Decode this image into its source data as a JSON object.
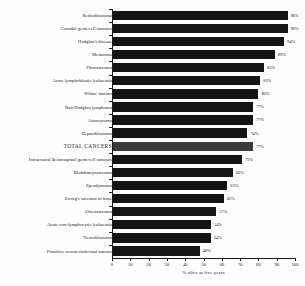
{
  "chart_data": {
    "type": "bar",
    "orientation": "horizontal",
    "title": "",
    "xlabel": "% alive at five years",
    "ylabel": "",
    "xlim": [
      0,
      100
    ],
    "xticks": [
      0,
      10,
      20,
      30,
      40,
      50,
      60,
      70,
      80,
      90,
      100
    ],
    "grid": false,
    "legend": null,
    "value_suffix": "%",
    "bar_color": "#141414",
    "highlight_color": "#3a3a3a",
    "highlight_category": "TOTAL CANCERS",
    "categories": [
      "Retinoblastoma",
      "Gonadal germ cell tumours",
      "Hodgkin's disease",
      "Melanoma",
      "Fibrosarcoma",
      "Acute lymphoblastic leukaemia",
      "Wilms' tumour",
      "Non-Hodgkin lymphoma",
      "Astrocytoma",
      "Hepatoblastoma",
      "TOTAL CANCERS",
      "Intracranial & intraspinal germ cell tumours",
      "Rhabdomyosarcoma",
      "Ependymoma",
      "Ewing's sarcoma of bone",
      "Osteosarcoma",
      "Acute non-lymphocytic leukaemia",
      "Neuroblastoma",
      "Primitive neuroectodermal tumour"
    ],
    "values": [
      96,
      96,
      94,
      89,
      83,
      81,
      80,
      77,
      77,
      74,
      77,
      71,
      66,
      63,
      61,
      57,
      54,
      54,
      48
    ],
    "value_labels": [
      "96%",
      "96%",
      "94%",
      "89%",
      "83%",
      "81%",
      "80%",
      "77%",
      "77%",
      "74%",
      "77%",
      "71%",
      "66%",
      "63%",
      "61%",
      "57%",
      "54%",
      "54%",
      "48%"
    ]
  }
}
